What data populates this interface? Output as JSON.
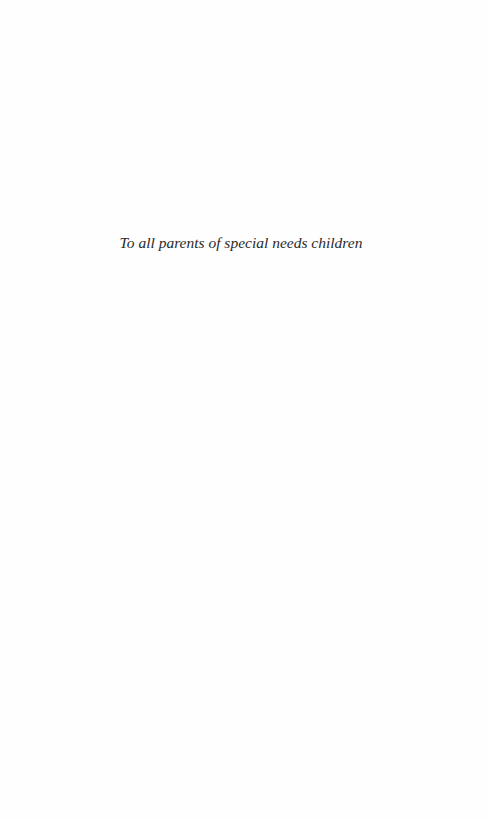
{
  "page": {
    "type": "dedication",
    "background": "#fefefe",
    "text_color": "#2a2a2a"
  },
  "dedication": {
    "text": "To all parents of special needs children"
  }
}
